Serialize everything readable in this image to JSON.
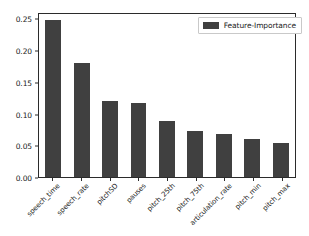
{
  "chart_data": {
    "type": "bar",
    "title": "",
    "xlabel": "",
    "ylabel": "",
    "ylim": [
      0.0,
      0.26
    ],
    "yticks": [
      "0.00",
      "0.05",
      "0.10",
      "0.15",
      "0.20",
      "0.25"
    ],
    "ytick_values": [
      0.0,
      0.05,
      0.1,
      0.15,
      0.2,
      0.25
    ],
    "grid": false,
    "legend_position": "upper right",
    "bar_color": "#404040",
    "categories": [
      "speech_time",
      "speech_rate",
      "pitchSD",
      "pauses",
      "pitch_25th",
      "pitch_75th",
      "articulation_rate",
      "pitch_min",
      "pitch_max"
    ],
    "series": [
      {
        "name": "Feature-Importance",
        "values": [
          0.247,
          0.18,
          0.119,
          0.117,
          0.088,
          0.072,
          0.068,
          0.06,
          0.054
        ]
      }
    ]
  },
  "legend": {
    "label": "Feature-Importance"
  }
}
